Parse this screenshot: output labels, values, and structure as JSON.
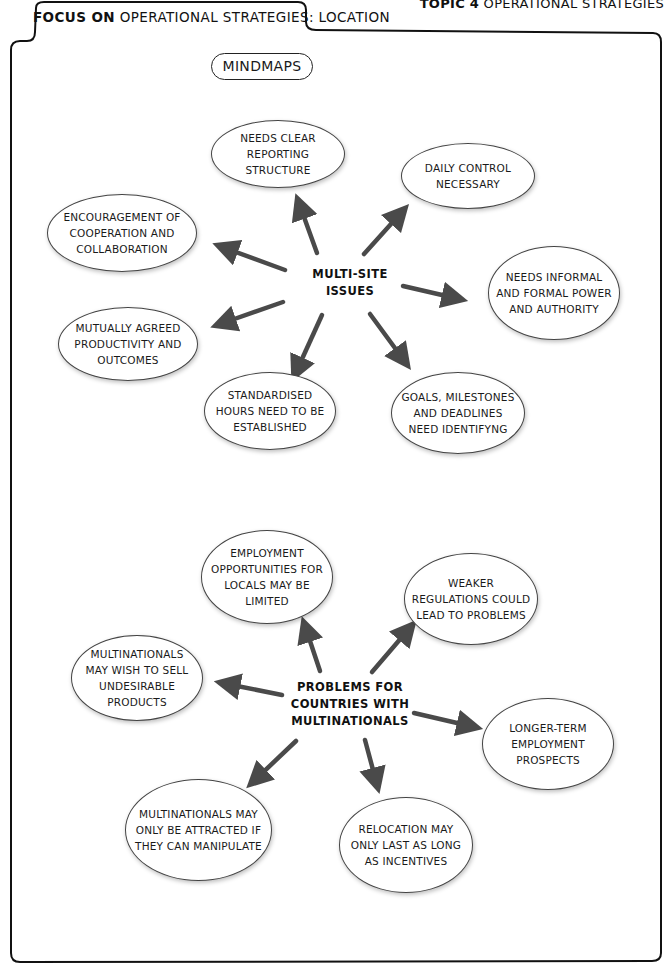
{
  "header": {
    "topic_bold": "TOPIC 4",
    "topic_rest": " OPERATIONAL STRATEGIES",
    "focus_bold": "FOCUS ON",
    "focus_rest": " OPERATIONAL STRATEGIES: LOCATION"
  },
  "section_title": "MINDMAPS",
  "colors": {
    "arrow": "#4a4a4a",
    "border": "#111111",
    "node_border": "#444444"
  },
  "mindmap_1": {
    "hub": "MULTI-SITE ISSUES",
    "nodes": [
      "NEEDS CLEAR REPORTING STRUCTURE",
      "DAILY CONTROL NECESSARY",
      "ENCOURAGEMENT OF COOPERATION AND COLLABORATION",
      "NEEDS INFORMAL AND FORMAL POWER AND AUTHORITY",
      "MUTUALLY AGREED PRODUCTIVITY AND OUTCOMES",
      "STANDARDISED HOURS NEED TO BE ESTABLISHED",
      "GOALS, MILESTONES AND DEADLINES NEED IDENTIFYNG"
    ]
  },
  "mindmap_2": {
    "hub": "PROBLEMS FOR COUNTRIES WITH MULTINATIONALS",
    "nodes": [
      "EMPLOYMENT OPPORTUNITIES FOR LOCALS MAY BE LIMITED",
      "WEAKER REGULATIONS COULD LEAD TO PROBLEMS",
      "MULTINATIONALS MAY WISH TO SELL UNDESIRABLE PRODUCTS",
      "LONGER-TERM EMPLOYMENT PROSPECTS",
      "MULTINATIONALS MAY ONLY BE ATTRACTED IF THEY CAN MANIPULATE",
      "RELOCATION MAY ONLY LAST AS LONG AS INCENTIVES"
    ]
  }
}
